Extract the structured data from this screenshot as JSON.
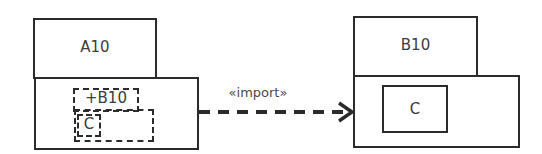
{
  "diagram": {
    "type": "UML package diagram",
    "packages": [
      {
        "name": "A10",
        "contents": [
          {
            "label": "+B10",
            "style": "dashed",
            "kind": "imported-package"
          },
          {
            "label": "C",
            "style": "dashed",
            "kind": "imported-element"
          }
        ]
      },
      {
        "name": "B10",
        "contents": [
          {
            "label": "C",
            "style": "solid",
            "kind": "element"
          }
        ]
      }
    ],
    "relationship": {
      "label": "«import»",
      "from": "A10",
      "to": "B10",
      "style": "dashed-open-arrow"
    }
  }
}
